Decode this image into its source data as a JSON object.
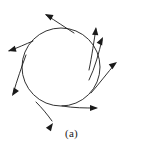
{
  "figure": {
    "caption": "(a)",
    "label_text": "(a)",
    "stroke_color": "#1a1a1a",
    "background_color": "#ffffff",
    "width": 143,
    "height": 148
  },
  "chart_data": {
    "type": "diagram",
    "title": "(a)",
    "subtitle": "",
    "xlabel": "",
    "ylabel": "",
    "grid": false,
    "legend": "none",
    "shape": {
      "kind": "circle",
      "center_x": 61,
      "center_y": 67,
      "radius": 39,
      "stroke_color": "#1a1a1a",
      "stroke_width": 0.9
    },
    "arrows": [
      {
        "name": "arrow-top-left",
        "direction": "up-left",
        "angle_deg": 152,
        "path": "M 74 33 C 66 28 56 21 46 15",
        "tip_x": 45,
        "tip_y": 14
      },
      {
        "name": "arrow-left-upper",
        "direction": "left",
        "angle_deg": 196,
        "path": "M 33 41 C 26 44 17 48 9 51",
        "tip_x": 8,
        "tip_y": 51
      },
      {
        "name": "arrow-left-lower",
        "direction": "down-left",
        "angle_deg": 237,
        "path": "M 26 55 C 22 66 17 80 13 94",
        "tip_x": 12,
        "tip_y": 96
      },
      {
        "name": "arrow-bottom-left",
        "direction": "down-right",
        "angle_deg": 55,
        "path": "M 36 102 C 42 108 47 114 52 121",
        "tip_x": 53,
        "tip_y": 123
      },
      {
        "name": "arrow-bottom-right",
        "direction": "right",
        "angle_deg": 0,
        "path": "M 62 106 C 74 108 85 108 96 108",
        "tip_x": 98,
        "tip_y": 108
      },
      {
        "name": "arrow-right-diagonal",
        "direction": "up-right",
        "angle_deg": 37,
        "path": "M 91 93 C 99 84 108 72 115 64",
        "tip_x": 117,
        "tip_y": 62
      },
      {
        "name": "arrow-right-upper",
        "direction": "up-right-steep",
        "angle_deg": 63,
        "path": "M 89 80 C 95 68 99 52 102 40",
        "tip_x": 103,
        "tip_y": 37
      },
      {
        "name": "arrow-top-right",
        "direction": "up",
        "angle_deg": 84,
        "path": "M 89 70 C 92 56 94 40 96 29",
        "tip_x": 96,
        "tip_y": 27
      }
    ]
  }
}
